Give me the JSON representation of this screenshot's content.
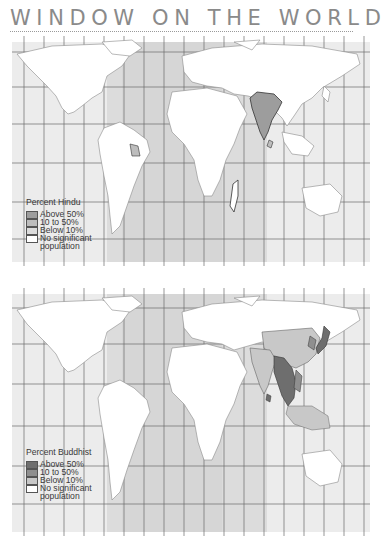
{
  "page": {
    "title": "WINDOW ON THE WORLD"
  },
  "maps": [
    {
      "id": "hindu",
      "legend": {
        "title": "Percent Hindu",
        "items": [
          {
            "label": "Above 50%",
            "color": "#9d9d9d"
          },
          {
            "label": "10 to 50%",
            "color": "#bdbdbd"
          },
          {
            "label": "Below 10%",
            "color": "#dcdcdc"
          },
          {
            "label": "No significant",
            "color": "#ffffff"
          }
        ],
        "continuation": "population"
      },
      "highlighted_regions": [
        {
          "region": "India",
          "category": "Above 50%"
        },
        {
          "region": "Nepal",
          "category": "Above 50%"
        },
        {
          "region": "Mauritius",
          "category": "Above 50%"
        },
        {
          "region": "Guyana / Suriname",
          "category": "10 to 50%"
        },
        {
          "region": "Sri Lanka",
          "category": "10 to 50%"
        },
        {
          "region": "Bangladesh",
          "category": "10 to 50%"
        },
        {
          "region": "Madagascar coast",
          "category": "Below 10%"
        }
      ]
    },
    {
      "id": "buddhist",
      "legend": {
        "title": "Percent Buddhist",
        "items": [
          {
            "label": "Above 50%",
            "color": "#6e6e6e"
          },
          {
            "label": "10 to 50%",
            "color": "#8f8f8f"
          },
          {
            "label": "Below 10%",
            "color": "#c8c8c8"
          },
          {
            "label": "No significant",
            "color": "#ffffff"
          }
        ],
        "continuation": "population"
      },
      "highlighted_regions": [
        {
          "region": "Myanmar / Thailand / Cambodia / Laos",
          "category": "Above 50%"
        },
        {
          "region": "Japan",
          "category": "Above 50%"
        },
        {
          "region": "Sri Lanka",
          "category": "Above 50%"
        },
        {
          "region": "China / Korea / Vietnam",
          "category": "10 to 50%"
        },
        {
          "region": "India / Indonesia / Malaysia",
          "category": "Below 10%"
        }
      ]
    }
  ],
  "colors": {
    "ocean": "#e8e8e8",
    "ocean_band": "#dedede",
    "land": "#ffffff",
    "border": "#8a8a8a",
    "grid": "#6a6a6a"
  }
}
